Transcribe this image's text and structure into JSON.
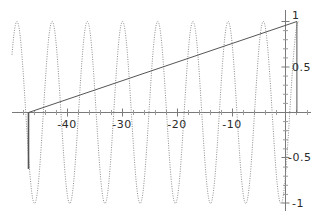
{
  "chart_data": {
    "type": "line",
    "title": "",
    "subtitle": "",
    "xlabel": "",
    "ylabel": "",
    "xlim": [
      -50,
      4
    ],
    "ylim": [
      -1.15,
      1.15
    ],
    "grid": false,
    "legend": null,
    "xticks": [
      -40,
      -30,
      -20,
      -10
    ],
    "xtick_labels": [
      "-40",
      "-30",
      "-20",
      "-10"
    ],
    "yticks": [
      1,
      0.5,
      -0.5,
      -1
    ],
    "ytick_labels": [
      "1",
      "0.5",
      "-0.5",
      "-1"
    ],
    "minor_ticks": true,
    "axis_color": "#7a7a7a",
    "series": [
      {
        "name": "oscillation",
        "type": "line",
        "style": "dotted",
        "color": "#8c8c8c",
        "description": "high frequency sinusoid of unit amplitude",
        "amplitude": 1,
        "period": 6.4,
        "peaks_x": [
          -42.7,
          -36.3,
          -29.9,
          -23.5,
          -17.1,
          -10.7,
          -4.3,
          1.8
        ],
        "troughs_x": [
          -45.9,
          -39.5,
          -33.1,
          -26.7,
          -20.3,
          -13.9,
          -7.5,
          -1.1
        ],
        "x_start": -50,
        "x_end": 2.2
      },
      {
        "name": "envelope-line",
        "type": "line",
        "style": "solid",
        "color": "#555555",
        "description": "straight rising line from zero crossing to peak",
        "points": [
          [
            -47.0,
            0.0
          ],
          [
            1.8,
            1.0
          ]
        ]
      },
      {
        "name": "vertical-drop-right",
        "type": "line",
        "style": "solid",
        "color": "#555555",
        "description": "vertical segment at right peak",
        "points": [
          [
            1.8,
            1.0
          ],
          [
            1.8,
            0.0
          ]
        ]
      },
      {
        "name": "vertical-drop-left",
        "type": "line",
        "style": "solid",
        "color": "#555555",
        "description": "vertical segment at left zero crossing",
        "points": [
          [
            -47.0,
            0.0
          ],
          [
            -47.0,
            -0.62
          ]
        ]
      }
    ]
  },
  "axes": {
    "x_axis_name": "horizontal-axis",
    "y_axis_name": "vertical-axis"
  }
}
